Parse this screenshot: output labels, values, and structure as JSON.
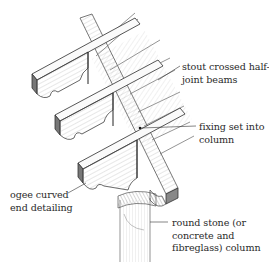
{
  "figure": {
    "type": "annotated pencil illustration",
    "colors": {
      "ink": "#2a2a2a",
      "pencil_dark": "#3a3a3a",
      "pencil_mid": "#8a8a8a",
      "pencil_light": "#c8c8c8",
      "background": "#ffffff"
    }
  },
  "annotations": [
    {
      "id": "beams",
      "text": "stout crossed half-\njoint beams"
    },
    {
      "id": "fixing",
      "text": "fixing set into\ncolumn"
    },
    {
      "id": "ogee",
      "text": "ogee curved\nend detailing"
    },
    {
      "id": "column",
      "text": "round stone (or\nconcrete and\nfibreglass) column"
    }
  ]
}
